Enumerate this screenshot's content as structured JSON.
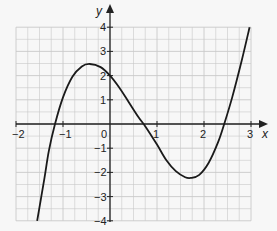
{
  "chart_data": {
    "type": "line",
    "title": "",
    "xlabel": "x",
    "ylabel": "y",
    "xlim": [
      -2,
      3
    ],
    "ylim": [
      -4,
      4
    ],
    "grid": true,
    "grid_minor_x": 0.25,
    "grid_minor_y": 0.5,
    "x_ticks": [
      "−2",
      "−1",
      "0",
      "1",
      "2",
      "3"
    ],
    "y_ticks": [
      "4",
      "3",
      "2",
      "1",
      "−1",
      "−2",
      "−3",
      "−4"
    ],
    "series": [
      {
        "name": "cubic curve",
        "x": [
          -1.55,
          -1.4,
          -1.3,
          -1.17,
          -1.0,
          -0.8,
          -0.6,
          -0.43,
          -0.2,
          0.0,
          0.2,
          0.4,
          0.6,
          0.77,
          1.0,
          1.2,
          1.4,
          1.6,
          1.72,
          1.9,
          2.1,
          2.3,
          2.43,
          2.6,
          2.8,
          2.97
        ],
        "y": [
          -4.0,
          -2.3,
          -1.1,
          0.0,
          1.1,
          1.95,
          2.38,
          2.48,
          2.35,
          2.0,
          1.5,
          0.9,
          0.3,
          -0.15,
          -0.85,
          -1.5,
          -1.95,
          -2.2,
          -2.23,
          -2.1,
          -1.6,
          -0.75,
          0.0,
          1.1,
          2.6,
          4.0
        ]
      }
    ],
    "key_points": {
      "local_max": [
        -0.43,
        2.48
      ],
      "local_min": [
        1.72,
        -2.23
      ],
      "y_intercept": 2,
      "roots": [
        -1.17,
        0.77,
        2.43
      ]
    }
  },
  "labels": {
    "x_axis": "x",
    "y_axis": "y",
    "origin": "0"
  },
  "colors": {
    "grid": "#c8c8c8",
    "axis": "#222222",
    "curve": "#1a1a1a",
    "background": "#f7f7f7"
  }
}
